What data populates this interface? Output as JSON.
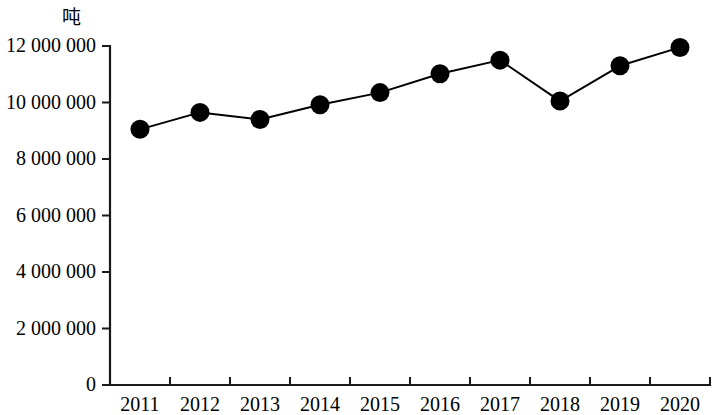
{
  "chart_data": {
    "type": "line",
    "title": "",
    "subtitle": "",
    "xlabel": "",
    "ylabel": "吨",
    "unit_label": "吨",
    "categories": [
      "2011",
      "2012",
      "2013",
      "2014",
      "2015",
      "2016",
      "2017",
      "2018",
      "2019",
      "2020"
    ],
    "values": [
      9050000,
      9650000,
      9400000,
      9920000,
      10350000,
      11020000,
      11500000,
      10050000,
      11300000,
      11950000
    ],
    "series": [
      {
        "name": "",
        "values": [
          9050000,
          9650000,
          9400000,
          9920000,
          10350000,
          11020000,
          11500000,
          10050000,
          11300000,
          11950000
        ]
      }
    ],
    "ylim": [
      0,
      12000000
    ],
    "ytick_values": [
      0,
      2000000,
      4000000,
      6000000,
      8000000,
      10000000,
      12000000
    ],
    "ytick_labels": [
      "0",
      "2 000 000",
      "4 000 000",
      "6 000 000",
      "8 000 000",
      "10 000 000",
      "12 000 000"
    ],
    "xtick_labels": [
      "2011",
      "2012",
      "2013",
      "2014",
      "2015",
      "2016",
      "2017",
      "2018",
      "2019",
      "2020"
    ],
    "grid": false,
    "legend": false,
    "legend_position": "none",
    "marker": "filled-circle",
    "line_color": "#000000",
    "marker_color": "#000000",
    "background_color": "#ffffff"
  }
}
